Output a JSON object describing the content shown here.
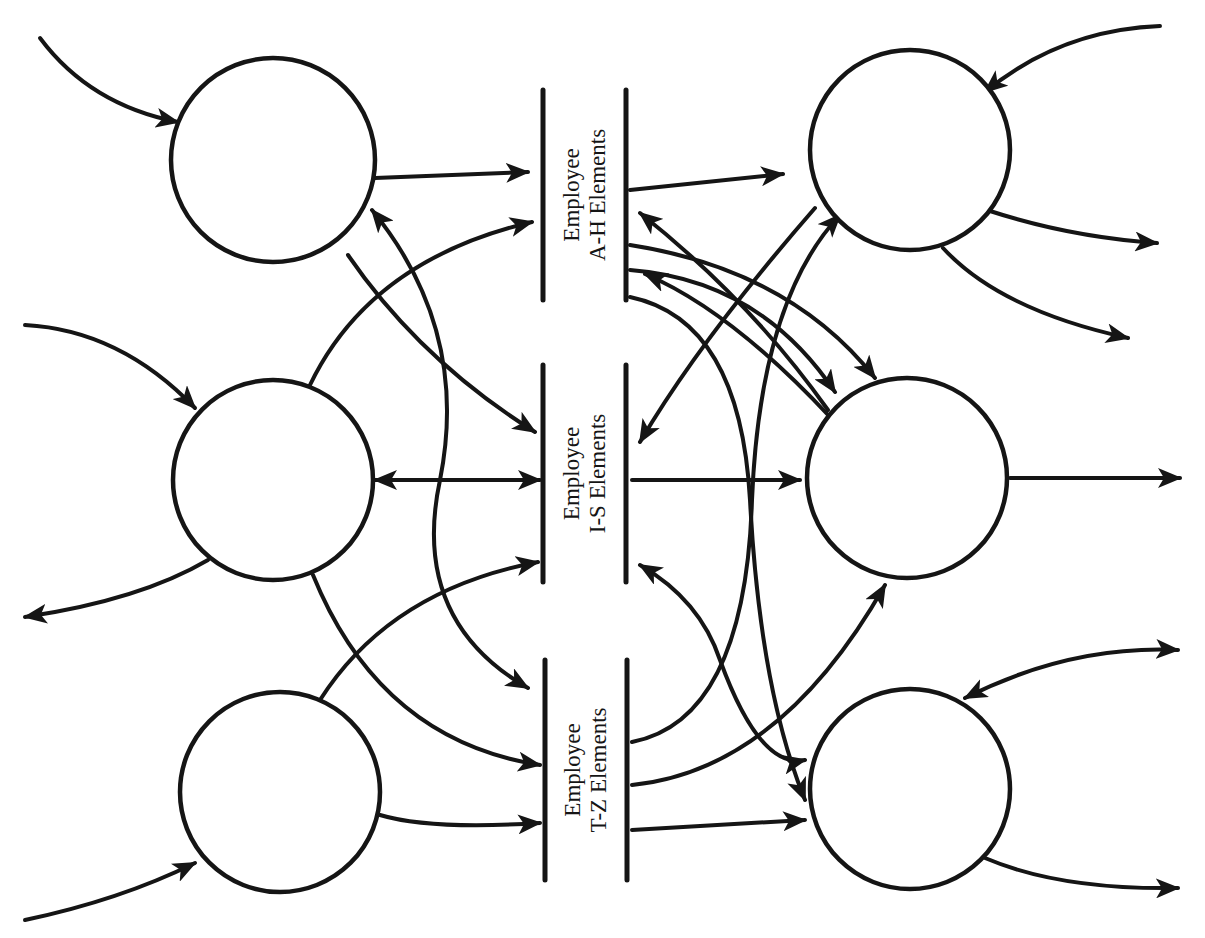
{
  "diagram": {
    "background": "#ffffff",
    "ink": "#151515",
    "processes": [
      {
        "id": "p-left-top",
        "cx": 273,
        "cy": 160,
        "r": 102
      },
      {
        "id": "p-left-mid",
        "cx": 273,
        "cy": 480,
        "r": 100
      },
      {
        "id": "p-left-bottom",
        "cx": 280,
        "cy": 792,
        "r": 100
      },
      {
        "id": "p-right-top",
        "cx": 910,
        "cy": 150,
        "r": 100
      },
      {
        "id": "p-right-mid",
        "cx": 907,
        "cy": 478,
        "r": 100
      },
      {
        "id": "p-right-bottom",
        "cx": 910,
        "cy": 789,
        "r": 100
      }
    ],
    "data_stores": [
      {
        "id": "store-a-h",
        "line1": "Employee",
        "line2": "A-H Elements",
        "y1": 90,
        "y2": 300,
        "xl": 543,
        "xr": 626
      },
      {
        "id": "store-i-s",
        "line1": "Employee",
        "line2": "I-S Elements",
        "y1": 365,
        "y2": 582,
        "xl": 543,
        "xr": 626
      },
      {
        "id": "store-t-z",
        "line1": "Employee",
        "line2": "T-Z Elements",
        "y1": 660,
        "y2": 880,
        "xl": 545,
        "xr": 627
      }
    ],
    "edges": [
      {
        "d": "M40 38 Q90 105 178 122",
        "end": true
      },
      {
        "d": "M375 178 L528 172",
        "end": true
      },
      {
        "d": "M348 255 Q420 360 535 432",
        "end": true
      },
      {
        "d": "M372 210 Q470 330 440 480 Q410 620 528 688",
        "start": true,
        "end": true
      },
      {
        "d": "M25 325 Q120 330 195 408",
        "end": true
      },
      {
        "d": "M310 385 Q370 260 532 222",
        "end": true
      },
      {
        "d": "M375 480 L540 480",
        "start": true,
        "end": true
      },
      {
        "d": "M208 560 Q140 600 25 617",
        "end": true
      },
      {
        "d": "M313 575 Q380 740 540 765",
        "end": true
      },
      {
        "d": "M25 920 Q120 900 195 863",
        "end": true
      },
      {
        "d": "M320 700 Q390 590 538 562",
        "end": true
      },
      {
        "d": "M380 815 Q430 830 540 823",
        "end": true
      },
      {
        "d": "M630 190 L783 174",
        "end": true
      },
      {
        "d": "M815 208 Q700 340 640 442",
        "end": true
      },
      {
        "d": "M630 245 Q790 270 875 378",
        "end": true
      },
      {
        "d": "M828 410 Q750 300 640 213",
        "end": true
      },
      {
        "d": "M630 270 Q760 280 835 392",
        "end": true
      },
      {
        "d": "M830 417 Q730 310 645 274",
        "end": true
      },
      {
        "d": "M630 297 Q740 320 750 500 Q760 690 805 800",
        "end": true
      },
      {
        "d": "M1160 26 Q1060 30 985 92",
        "end": true
      },
      {
        "d": "M990 211 Q1070 237 1157 243",
        "end": true
      },
      {
        "d": "M943 248 Q1000 310 1128 338",
        "end": true
      },
      {
        "d": "M632 480 L800 480",
        "end": true
      },
      {
        "d": "M1010 478 L1180 478",
        "end": true
      },
      {
        "d": "M640 565 Q700 600 720 660 Q760 770 805 760",
        "start": true,
        "end": true
      },
      {
        "d": "M632 742 Q745 720 752 500 Q760 300 840 215",
        "end": true
      },
      {
        "d": "M632 785 Q780 770 885 585",
        "end": true
      },
      {
        "d": "M632 830 L805 820",
        "end": true
      },
      {
        "d": "M1178 650 Q1070 645 965 698",
        "start": true,
        "end": true
      },
      {
        "d": "M985 858 Q1060 890 1178 888",
        "end": true
      }
    ]
  }
}
